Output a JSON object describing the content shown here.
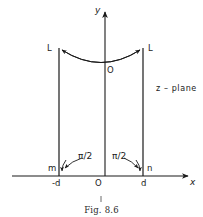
{
  "figure": {
    "caption": "Fig. 8.6",
    "plane_label": "z – plane",
    "axes": {
      "y_label": "y",
      "x_label": "x",
      "origin_label": "O"
    },
    "contour": {
      "arc_label": "O",
      "left_ray_label": "L",
      "right_ray_label": "L",
      "left_corner_label": "m",
      "right_corner_label": "n",
      "left_tick_label": "-d",
      "right_tick_label": "d",
      "left_angle_label": "π/2",
      "right_angle_label": "π/2"
    },
    "colors": {
      "ink": "#1a1a1a",
      "background": "#ffffff"
    }
  }
}
